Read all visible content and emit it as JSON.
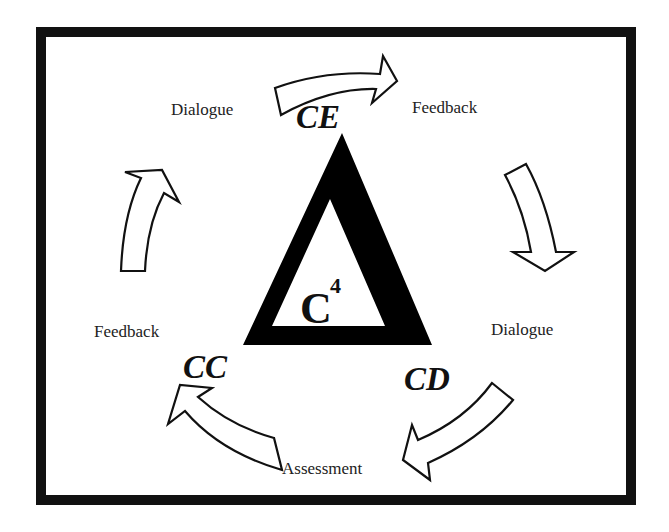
{
  "diagram": {
    "center": {
      "label": "C",
      "superscript": "4",
      "shape": "triangle"
    },
    "nodes": [
      {
        "id": "CE",
        "label": "CE",
        "position": "top"
      },
      {
        "id": "CD",
        "label": "CD",
        "position": "bottom-right"
      },
      {
        "id": "CC",
        "label": "CC",
        "position": "bottom-left"
      }
    ],
    "labels": {
      "top_left": "Dialogue",
      "top_right": "Feedback",
      "right": "Dialogue",
      "left": "Feedback",
      "bottom": "Assessment"
    },
    "edges": [
      {
        "from": "CE",
        "to": "CD",
        "direction": "clockwise",
        "labels": [
          "Feedback",
          "Dialogue"
        ]
      },
      {
        "from": "CD",
        "to": "CC",
        "direction": "clockwise",
        "labels": [
          "Assessment"
        ]
      },
      {
        "from": "CC",
        "to": "CE",
        "direction": "clockwise",
        "labels": [
          "Feedback",
          "Dialogue"
        ]
      }
    ],
    "colors": {
      "stroke": "#111111",
      "fill": "#ffffff",
      "triangle": "#000000"
    }
  }
}
